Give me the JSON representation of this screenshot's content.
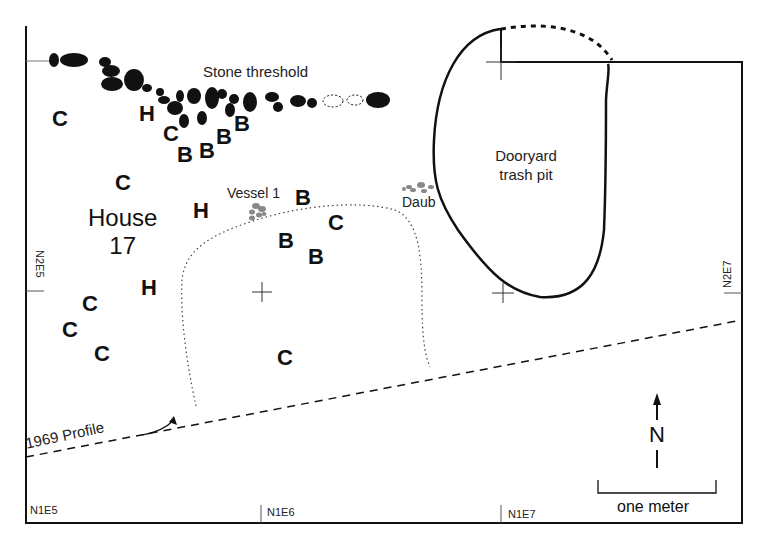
{
  "map": {
    "title": "House 17 excavation plan",
    "house_label_line1": "House",
    "house_label_line2": "17",
    "features": {
      "stone_threshold": "Stone threshold",
      "trash_pit_line1": "Dooryard",
      "trash_pit_line2": "trash pit",
      "vessel": "Vessel 1",
      "daub": "Daub",
      "profile": "1969 Profile"
    },
    "grid_labels": {
      "n2e5": "N2E5",
      "n2e7": "N2E7",
      "n1e5": "N1E5",
      "n1e6": "N1E6",
      "n1e7": "N1E7"
    },
    "north_arrow": "N",
    "scale_bar": "one meter",
    "artifacts": [
      {
        "code": "C",
        "x": 52,
        "y": 108
      },
      {
        "code": "H",
        "x": 139,
        "y": 103
      },
      {
        "code": "C",
        "x": 163,
        "y": 123
      },
      {
        "code": "B",
        "x": 177,
        "y": 144
      },
      {
        "code": "B",
        "x": 199,
        "y": 140
      },
      {
        "code": "B",
        "x": 216,
        "y": 126
      },
      {
        "code": "B",
        "x": 234,
        "y": 113
      },
      {
        "code": "C",
        "x": 115,
        "y": 172
      },
      {
        "code": "H",
        "x": 193,
        "y": 200
      },
      {
        "code": "B",
        "x": 295,
        "y": 187
      },
      {
        "code": "C",
        "x": 328,
        "y": 212
      },
      {
        "code": "B",
        "x": 278,
        "y": 230
      },
      {
        "code": "B",
        "x": 308,
        "y": 246
      },
      {
        "code": "H",
        "x": 141,
        "y": 277
      },
      {
        "code": "C",
        "x": 82,
        "y": 293
      },
      {
        "code": "C",
        "x": 62,
        "y": 319
      },
      {
        "code": "C",
        "x": 94,
        "y": 343
      },
      {
        "code": "C",
        "x": 277,
        "y": 347
      }
    ],
    "colors": {
      "ink": "#111111",
      "daub_gray": "#888888",
      "background": "#ffffff"
    }
  }
}
